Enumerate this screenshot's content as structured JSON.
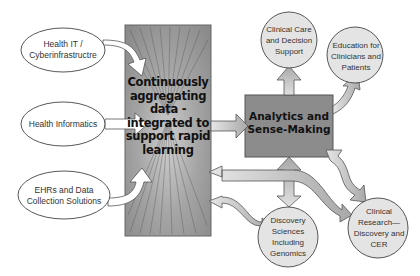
{
  "diagram": {
    "inputs": [
      {
        "label": "Health IT / Cyberinfrastructre"
      },
      {
        "label": "Health Informatics"
      },
      {
        "label": "EHRs and Data Collection Solutions"
      }
    ],
    "hub": {
      "label": "Continuously aggregating data - integrated to support rapid learning"
    },
    "analytics": {
      "label": "Analytics and Sense-Making"
    },
    "outputs": [
      {
        "label": "Clinical Care and Decision Support"
      },
      {
        "label": "Education for Clinicians and Patients"
      },
      {
        "label": "Discovery Sciences Including Genomics"
      },
      {
        "label": "Clinical Research— Discovery and CER"
      }
    ],
    "colors": {
      "box_fill": "#8c8c8c",
      "circle_fill": "#e4e4e4",
      "arrow_fill": "#c8c8c8",
      "stroke": "#555555"
    }
  }
}
